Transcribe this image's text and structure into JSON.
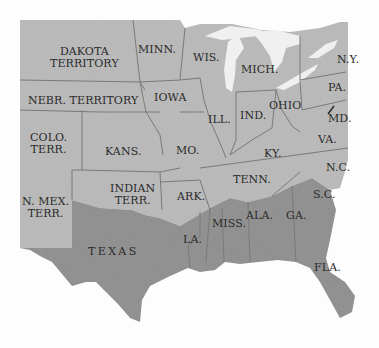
{
  "map": {
    "title": "",
    "colors": {
      "union_territory": "#b9b9b9",
      "confederate": "#8e8e8e",
      "lakes": "#f0f0f0",
      "border": "#7a7a7a",
      "background": "#fdfdfd"
    },
    "labels": {
      "dakota": "DAKOTA\nTERRITORY",
      "minn": "MINN.",
      "wis": "WIS.",
      "mich": "MICH.",
      "ny": "N.Y.",
      "nebr": "NEBR. TERRITORY",
      "iowa": "IOWA",
      "ill": "ILL.",
      "ind": "IND.",
      "ohio": "OHIO",
      "pa": "PA.",
      "md": "MD.",
      "colo": "COLO.\nTERR.",
      "kans": "KANS.",
      "mo": "MO.",
      "ky": "KY.",
      "va": "VA.",
      "nc": "N.C.",
      "tenn": "TENN.",
      "nmex": "N. MEX.\nTERR.",
      "indian": "INDIAN\nTERR.",
      "ark": "ARK.",
      "sc": "S.C.",
      "ala": "ALA.",
      "ga": "GA.",
      "miss": "MISS.",
      "la": "LA.",
      "texas": "TEXAS",
      "fla": "FLA."
    }
  }
}
